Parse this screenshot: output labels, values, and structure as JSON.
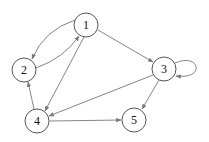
{
  "diagram": {
    "type": "directed-graph",
    "colors": {
      "node_stroke": "#555555",
      "edge": "#777777",
      "label": "#111111",
      "background": "#ffffff"
    },
    "nodes": [
      {
        "id": "1",
        "label": "1",
        "x": 86,
        "y": 25,
        "r": 12
      },
      {
        "id": "2",
        "label": "2",
        "x": 24,
        "y": 70,
        "r": 12
      },
      {
        "id": "3",
        "label": "3",
        "x": 164,
        "y": 69,
        "r": 12
      },
      {
        "id": "4",
        "label": "4",
        "x": 37,
        "y": 121,
        "r": 12
      },
      {
        "id": "5",
        "label": "5",
        "x": 134,
        "y": 120,
        "r": 12
      }
    ],
    "edges": [
      {
        "from": "1",
        "to": "2"
      },
      {
        "from": "2",
        "to": "1"
      },
      {
        "from": "1",
        "to": "3"
      },
      {
        "from": "1",
        "to": "4"
      },
      {
        "from": "3",
        "to": "3"
      },
      {
        "from": "3",
        "to": "4"
      },
      {
        "from": "3",
        "to": "5"
      },
      {
        "from": "4",
        "to": "2"
      },
      {
        "from": "4",
        "to": "5"
      }
    ]
  }
}
